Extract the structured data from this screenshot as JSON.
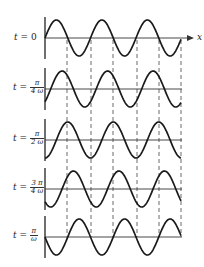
{
  "diagram": {
    "axis_label": "x",
    "rows": [
      {
        "label_prefix": "t =",
        "numerator": "",
        "denominator": "",
        "simple": "0",
        "phase": 0,
        "baseline_y": 38
      },
      {
        "label_prefix": "t =",
        "numerator": "π",
        "denominator": "4 ω",
        "simple": "",
        "phase": 0.7853981634,
        "baseline_y": 89
      },
      {
        "label_prefix": "t =",
        "numerator": "π",
        "denominator": "2 ω",
        "simple": "",
        "phase": 1.5707963268,
        "baseline_y": 140
      },
      {
        "label_prefix": "t =",
        "numerator": "3 π",
        "denominator": "4 ω",
        "simple": "",
        "phase": 2.3561944902,
        "baseline_y": 189
      },
      {
        "label_prefix": "t =",
        "numerator": "π",
        "denominator": "ω",
        "simple": "",
        "phase": 3.1415926536,
        "baseline_y": 237
      }
    ],
    "geometry": {
      "axis_x": 45,
      "wave_end_x": 181,
      "arrow_end_x": 194,
      "wavelength_px": 45.5,
      "amplitude_px": 18,
      "axis_half_height": 21,
      "dashed_lines_x": [
        67,
        91,
        113,
        137,
        159,
        181
      ],
      "dashed_top_y": 40,
      "dashed_bottom_y": 237
    },
    "colors": {
      "stroke": "#1a1a1a",
      "axis": "#333333",
      "dash": "#444444"
    }
  }
}
